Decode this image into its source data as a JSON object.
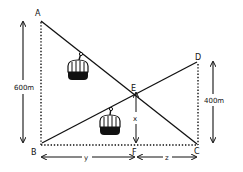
{
  "diagram": {
    "type": "geometry",
    "points": {
      "A": {
        "label": "A",
        "x": 40,
        "y": 20
      },
      "B": {
        "label": "B",
        "x": 41,
        "y": 145
      },
      "C": {
        "label": "C",
        "x": 198,
        "y": 145
      },
      "D": {
        "label": "D",
        "x": 198,
        "y": 62
      },
      "E": {
        "label": "E",
        "x": 136,
        "y": 89
      },
      "F": {
        "label": "F",
        "x": 136,
        "y": 145
      }
    },
    "dimensions": {
      "left_height": "600m",
      "right_height": "400m",
      "ef_height": "x",
      "bf_length": "y",
      "fc_length": "z"
    },
    "cable_cars": [
      {
        "name": "cable-car-upper",
        "cable": "AC"
      },
      {
        "name": "cable-car-lower",
        "cable": "BD"
      }
    ],
    "colors": {
      "ink": "#111111",
      "background": "#ffffff"
    }
  }
}
